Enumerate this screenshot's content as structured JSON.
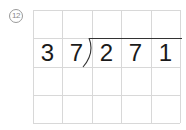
{
  "problem": {
    "number_label": "12",
    "number_glyph": "⑫"
  },
  "division": {
    "divisor": [
      "3",
      "7"
    ],
    "dividend": [
      "2",
      "7",
      "1"
    ],
    "quotient": [
      "",
      "",
      "",
      "",
      ""
    ]
  },
  "grid": {
    "columns": 5,
    "rows": 4,
    "line_color": "#d8d8d8",
    "digit_color": "#1a1a1a"
  }
}
